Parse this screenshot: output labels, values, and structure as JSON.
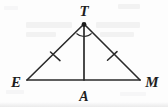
{
  "figure": {
    "background_color": "#fdfdfd",
    "stroke_color": "#2a2a2a",
    "label_color": "#1d1d1d"
  },
  "labels": {
    "apex": "T",
    "left_base": "E",
    "right_base": "M",
    "foot": "A"
  },
  "vertices": {
    "T": {
      "x": 84,
      "y": 24
    },
    "E": {
      "x": 27,
      "y": 80
    },
    "M": {
      "x": 140,
      "y": 80
    },
    "A": {
      "x": 84,
      "y": 80
    }
  },
  "label_positions": {
    "T": {
      "x": 84,
      "y": 14
    },
    "E": {
      "x": 16,
      "y": 84
    },
    "M": {
      "x": 152,
      "y": 84
    },
    "A": {
      "x": 84,
      "y": 98
    }
  },
  "segments": [
    {
      "name": "side-ET",
      "from": "E",
      "to": "T",
      "tick_count": 1
    },
    {
      "name": "side-TM",
      "from": "T",
      "to": "M",
      "tick_count": 1
    },
    {
      "name": "base-EM",
      "from": "E",
      "to": "M",
      "tick_count": 0
    },
    {
      "name": "altitude-TA",
      "from": "T",
      "to": "A",
      "tick_count": 0
    }
  ],
  "congruence_marks": {
    "left_tick": {
      "x": 55,
      "y": 52
    },
    "right_tick": {
      "x": 112,
      "y": 52
    }
  },
  "angle_marks": {
    "at_vertex": "T",
    "arc_count": 2,
    "meaning": "angle-bisector"
  },
  "geometry_notes": {
    "triangle": "ETM",
    "apex_vertex": "T",
    "base": "EM",
    "altitude_foot": "A"
  }
}
